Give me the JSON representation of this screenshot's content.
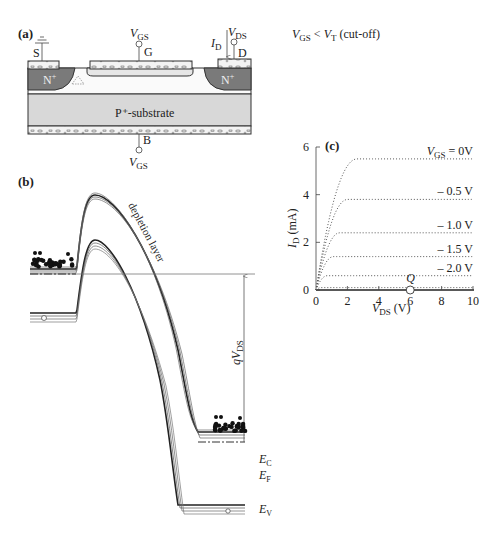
{
  "panel_a": {
    "label": "(a)",
    "condition": {
      "v": "V",
      "gs_sub": "GS",
      "lt": " < ",
      "v2": "V",
      "t_sub": "T",
      "note": "  (cut-off)"
    },
    "terminals": {
      "source": "S",
      "gate": "G",
      "drain": "D",
      "body": "B",
      "gate_voltage": {
        "v": "V",
        "sub": "GS"
      },
      "drain_voltage": {
        "v": "V",
        "sub": "DS"
      },
      "drain_current": {
        "v": "I",
        "sub": "D"
      },
      "body_voltage": {
        "v": "V",
        "sub": "GS"
      }
    },
    "regions": {
      "source_n": "N",
      "drain_n": "N",
      "plus": "+",
      "substrate": "P⁺-substrate"
    },
    "colors": {
      "n_region": "#7a7a7a",
      "substrate": "#d8d8d8",
      "metal": "#f0f0f0"
    }
  },
  "panel_b": {
    "label": "(b)",
    "depletion_label": "depletion layer",
    "qvds": {
      "q": "qV",
      "sub": "DS"
    },
    "levels": {
      "ec": {
        "e": "E",
        "sub": "C"
      },
      "ef": {
        "e": "E",
        "sub": "F"
      },
      "ev": {
        "e": "E",
        "sub": "V"
      }
    }
  },
  "chart_data": {
    "type": "line",
    "label": "(c)",
    "xlabel": {
      "v": "V",
      "sub": "DS",
      "unit": " (V)"
    },
    "ylabel": {
      "v": "I",
      "sub": "D",
      "unit": " (mA)"
    },
    "xlim": [
      0,
      10
    ],
    "ylim": [
      0,
      6
    ],
    "xticks": [
      0,
      2,
      4,
      6,
      8,
      10
    ],
    "yticks": [
      0,
      2,
      4,
      6
    ],
    "series": [
      {
        "name": "V_GS = 0V",
        "label_v": "V",
        "label_sub": "GS",
        "label_rest": " = 0V",
        "isat": 5.5,
        "vsat": 2.6
      },
      {
        "name": "-0.5 V",
        "label": "– 0.5 V",
        "isat": 3.8,
        "vsat": 2.0
      },
      {
        "name": "-1.0 V",
        "label": "– 1.0 V",
        "isat": 2.4,
        "vsat": 1.5
      },
      {
        "name": "-1.5 V",
        "label": "– 1.5 V",
        "isat": 1.4,
        "vsat": 1.1
      },
      {
        "name": "-2.0 V",
        "label": "– 2.0 V",
        "isat": 0.6,
        "vsat": 0.7
      },
      {
        "name": "cut-off",
        "label": "",
        "isat": 0.1,
        "vsat": 0.3
      }
    ],
    "operating_point": {
      "label": "Q",
      "x": 6,
      "y": 0
    },
    "grid": false
  }
}
